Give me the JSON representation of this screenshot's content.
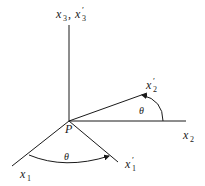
{
  "diagram": {
    "origin_label": "P",
    "axes": {
      "x3": {
        "label": "x",
        "sub": "3",
        "label2": "x",
        "sub2": "3",
        "prime2": "′",
        "separator": ","
      },
      "x2": {
        "label": "x",
        "sub": "2"
      },
      "x2_prime": {
        "label": "x",
        "sub": "2",
        "prime": "′"
      },
      "x1": {
        "label": "x",
        "sub": "1"
      },
      "x1_prime": {
        "label": "x",
        "sub": "1",
        "prime": "′"
      }
    },
    "angles": {
      "upper": "θ",
      "lower": "θ"
    },
    "colors": {
      "line": "#1a1a1a",
      "background": "#ffffff"
    }
  }
}
